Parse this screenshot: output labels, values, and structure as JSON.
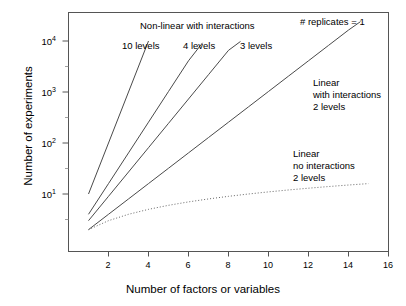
{
  "chart_data": {
    "type": "line",
    "title": "",
    "xlabel": "Number of factors or variables",
    "ylabel": "Number of experiments",
    "xlim": [
      0,
      16
    ],
    "ylim": [
      2,
      30000
    ],
    "yscale": "log",
    "grid": false,
    "legend": "annotations-inline",
    "xticks": [
      "2",
      "4",
      "6",
      "8",
      "10",
      "12",
      "14",
      "16"
    ],
    "xtick_values": [
      2,
      4,
      6,
      8,
      10,
      12,
      14,
      16
    ],
    "ytick_labels": [
      "10",
      "10",
      "10",
      "10"
    ],
    "ytick_exponents": [
      "1",
      "2",
      "3",
      "4"
    ],
    "ytick_values": [
      10,
      100,
      1000,
      10000
    ],
    "annotations": [
      {
        "name": "replicates-note",
        "text": "# replicates = 1"
      },
      {
        "name": "nonlinear-heading",
        "text": "Non-linear with interactions"
      },
      {
        "name": "ten-levels-label",
        "text": "10 levels"
      },
      {
        "name": "four-levels-label",
        "text": "4 levels"
      },
      {
        "name": "three-levels-label",
        "text": "3 levels"
      },
      {
        "name": "linear-interactions-l1",
        "text": "Linear"
      },
      {
        "name": "linear-interactions-l2",
        "text": "with interactions"
      },
      {
        "name": "linear-interactions-l3",
        "text": "2 levels"
      },
      {
        "name": "linear-nointeractions-l1",
        "text": "Linear"
      },
      {
        "name": "linear-nointeractions-l2",
        "text": "no interactions"
      },
      {
        "name": "linear-nointeractions-l3",
        "text": "2 levels"
      }
    ],
    "series": [
      {
        "name": "10 levels (non-linear with interactions)",
        "style": "solid",
        "color": "#4a4a4a",
        "x": [
          1,
          2,
          3,
          4
        ],
        "values": [
          10,
          100,
          1000,
          10000
        ]
      },
      {
        "name": "4 levels (non-linear with interactions)",
        "style": "solid",
        "color": "#4a4a4a",
        "x": [
          1,
          2,
          3,
          4,
          5,
          6,
          6.7
        ],
        "values": [
          4,
          16,
          64,
          256,
          1024,
          4096,
          9200
        ]
      },
      {
        "name": "3 levels (non-linear with interactions)",
        "style": "solid",
        "color": "#4a4a4a",
        "x": [
          1,
          2,
          3,
          4,
          5,
          6,
          7,
          8,
          8.6
        ],
        "values": [
          3,
          9,
          27,
          81,
          243,
          729,
          2187,
          6561,
          9800
        ]
      },
      {
        "name": "2 levels (linear with interactions)",
        "style": "solid",
        "color": "#4a4a4a",
        "x": [
          1,
          2,
          3,
          4,
          5,
          6,
          7,
          8,
          9,
          10,
          11,
          12,
          13,
          14,
          14.6
        ],
        "values": [
          2,
          4,
          8,
          16,
          32,
          64,
          128,
          256,
          512,
          1024,
          2048,
          4096,
          8192,
          16384,
          24000
        ]
      },
      {
        "name": "2 levels (linear, no interactions)",
        "style": "dotted",
        "color": "#666666",
        "x": [
          1,
          2,
          3,
          4,
          5,
          6,
          7,
          8,
          9,
          10,
          11,
          12,
          13,
          14,
          15
        ],
        "values": [
          2,
          3,
          4,
          5,
          6,
          7,
          8,
          9,
          10,
          11,
          12,
          13,
          14,
          15,
          16
        ]
      }
    ]
  },
  "axes": {
    "x_title": "Number of factors or variables",
    "y_title": "Number of experiments"
  },
  "colors": {
    "frame": "#555555",
    "line": "#4a4a4a",
    "dotted": "#666666",
    "background": "#ffffff",
    "text": "#000000"
  }
}
